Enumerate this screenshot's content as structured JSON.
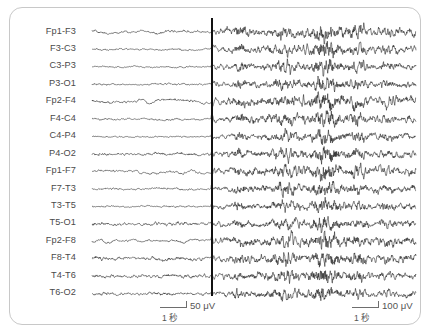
{
  "panel": {
    "title": "EEG multichannel recording",
    "background_color": "#ffffff",
    "border_color": "#c8c8c8",
    "trace_color": "#1a1a1a",
    "label_color": "#4a4a4a",
    "marker_color": "#111111"
  },
  "montage": {
    "channel_count": 16,
    "first_trace_y": 32,
    "trace_spacing": 17.45,
    "trace_left_x": 92,
    "trace_right_x": 416,
    "channels": [
      {
        "label": "Fp1-F3",
        "amp_left": 1.05,
        "amp_right": 3.4,
        "drift": 2.6,
        "seed": 11
      },
      {
        "label": "F3-C3",
        "amp_left": 0.75,
        "amp_right": 3.0,
        "drift": 0.9,
        "seed": 23
      },
      {
        "label": "C3-P3",
        "amp_left": 0.6,
        "amp_right": 2.5,
        "drift": 0.5,
        "seed": 37
      },
      {
        "label": "P3-O1",
        "amp_left": 0.85,
        "amp_right": 2.5,
        "drift": 0.6,
        "seed": 41
      },
      {
        "label": "Fp2-F4",
        "amp_left": 1.15,
        "amp_right": 3.8,
        "drift": 3.0,
        "seed": 53
      },
      {
        "label": "F4-C4",
        "amp_left": 0.8,
        "amp_right": 3.1,
        "drift": 0.8,
        "seed": 67
      },
      {
        "label": "C4-P4",
        "amp_left": 0.55,
        "amp_right": 2.4,
        "drift": 0.5,
        "seed": 71
      },
      {
        "label": "P4-O2",
        "amp_left": 1.3,
        "amp_right": 2.8,
        "drift": 0.7,
        "seed": 83
      },
      {
        "label": "Fp1-F7",
        "amp_left": 0.95,
        "amp_right": 3.3,
        "drift": 2.2,
        "seed": 97
      },
      {
        "label": "F7-T3",
        "amp_left": 0.8,
        "amp_right": 2.9,
        "drift": 1.0,
        "seed": 103
      },
      {
        "label": "T3-T5",
        "amp_left": 0.7,
        "amp_right": 2.6,
        "drift": 0.8,
        "seed": 113
      },
      {
        "label": "T5-O1",
        "amp_left": 1.45,
        "amp_right": 2.7,
        "drift": 0.6,
        "seed": 127
      },
      {
        "label": "Fp2-F8",
        "amp_left": 0.95,
        "amp_right": 3.5,
        "drift": 2.8,
        "seed": 139
      },
      {
        "label": "F8-T4",
        "amp_left": 1.6,
        "amp_right": 3.2,
        "drift": 0.9,
        "seed": 149
      },
      {
        "label": "T4-T6",
        "amp_left": 1.55,
        "amp_right": 2.8,
        "drift": 0.7,
        "seed": 157
      },
      {
        "label": "T6-O2",
        "amp_left": 1.35,
        "amp_right": 2.6,
        "drift": 0.6,
        "seed": 167
      }
    ]
  },
  "marker": {
    "name": "event-onset-marker",
    "x": 211,
    "top": 18,
    "height": 278,
    "width": 2
  },
  "bursts": [
    {
      "center": 0.33,
      "width": 0.03,
      "gain": 3.2
    },
    {
      "center": 0.455,
      "width": 0.016,
      "gain": 2.2
    },
    {
      "center": 0.605,
      "width": 0.042,
      "gain": 4.3
    },
    {
      "center": 0.715,
      "width": 0.04,
      "gain": 4.6
    },
    {
      "center": 0.825,
      "width": 0.03,
      "gain": 3.4
    },
    {
      "center": 0.905,
      "width": 0.026,
      "gain": 2.6
    }
  ],
  "scales": {
    "left": {
      "name": "scale-bar-left",
      "x": 160,
      "y": 300,
      "rule_width": 26,
      "amplitude_label": "50 μV",
      "time_label": "1 秒"
    },
    "right": {
      "name": "scale-bar-right",
      "x": 352,
      "y": 300,
      "rule_width": 26,
      "amplitude_label": "100 μV",
      "time_label": "1 秒"
    }
  }
}
